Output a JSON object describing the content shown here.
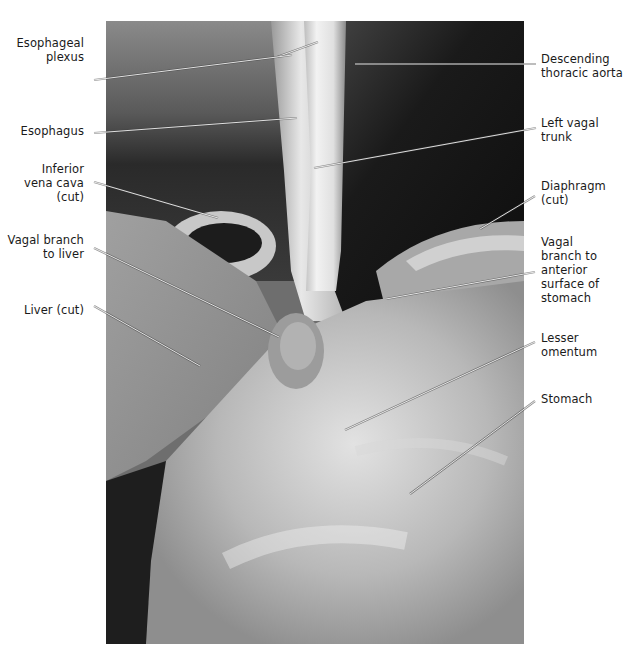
{
  "figure": {
    "photo": {
      "subject": "dissection-esophagus-diaphragm-stomach",
      "bbox": [
        106,
        21,
        524,
        644
      ]
    },
    "labels_left": [
      {
        "id": "esophageal-plexus",
        "text": "Esophageal\nplexus",
        "x": 0,
        "y": 36,
        "w": 84,
        "leader": [
          [
            94,
            80
          ],
          [
            277,
            57
          ],
          [
            318,
            42
          ]
        ],
        "leader2": [
          [
            277,
            57
          ],
          [
            292,
            55
          ]
        ]
      },
      {
        "id": "esophagus",
        "text": "Esophagus",
        "x": 0,
        "y": 124,
        "w": 84,
        "leader": [
          [
            94,
            133
          ],
          [
            297,
            118
          ]
        ]
      },
      {
        "id": "inferior-vena-cava",
        "text": "Inferior\nvena cava\n(cut)",
        "x": 0,
        "y": 162,
        "w": 84,
        "leader": [
          [
            94,
            182
          ],
          [
            218,
            218
          ]
        ]
      },
      {
        "id": "vagal-branch-to-liver",
        "text": "Vagal branch\nto liver",
        "x": 0,
        "y": 233,
        "w": 84,
        "leader": [
          [
            94,
            248
          ],
          [
            279,
            337
          ]
        ]
      },
      {
        "id": "liver-cut",
        "text": "Liver (cut)",
        "x": 0,
        "y": 303,
        "w": 84,
        "leader": [
          [
            94,
            306
          ],
          [
            200,
            366
          ]
        ]
      }
    ],
    "labels_right": [
      {
        "id": "descending-thoracic-aorta",
        "text": "Descending\nthoracic aorta",
        "x": 541,
        "y": 52,
        "leader": [
          [
            536,
            64
          ],
          [
            355,
            64
          ]
        ]
      },
      {
        "id": "left-vagal-trunk",
        "text": "Left vagal\ntrunk",
        "x": 541,
        "y": 116,
        "leader": [
          [
            536,
            128
          ],
          [
            314,
            168
          ]
        ]
      },
      {
        "id": "diaphragm-cut",
        "text": "Diaphragm\n(cut)",
        "x": 541,
        "y": 179,
        "leader": [
          [
            535,
            196
          ],
          [
            480,
            229
          ]
        ]
      },
      {
        "id": "vagal-branch-anterior-stomach",
        "text": "Vagal\nbranch to\nanterior\nsurface of\nstomach",
        "x": 541,
        "y": 235,
        "leader": [
          [
            535,
            272
          ],
          [
            386,
            299
          ]
        ]
      },
      {
        "id": "lesser-omentum",
        "text": "Lesser\nomentum",
        "x": 541,
        "y": 331,
        "leader": [
          [
            535,
            342
          ],
          [
            345,
            430
          ]
        ]
      },
      {
        "id": "stomach",
        "text": "Stomach",
        "x": 541,
        "y": 392,
        "leader": [
          [
            535,
            401
          ],
          [
            410,
            494
          ]
        ]
      }
    ],
    "colors": {
      "background": "#ffffff",
      "label_text": "#1a1a1a",
      "leader_line": "#f2f2f2",
      "leader_outline": "#3a3a3a"
    }
  }
}
